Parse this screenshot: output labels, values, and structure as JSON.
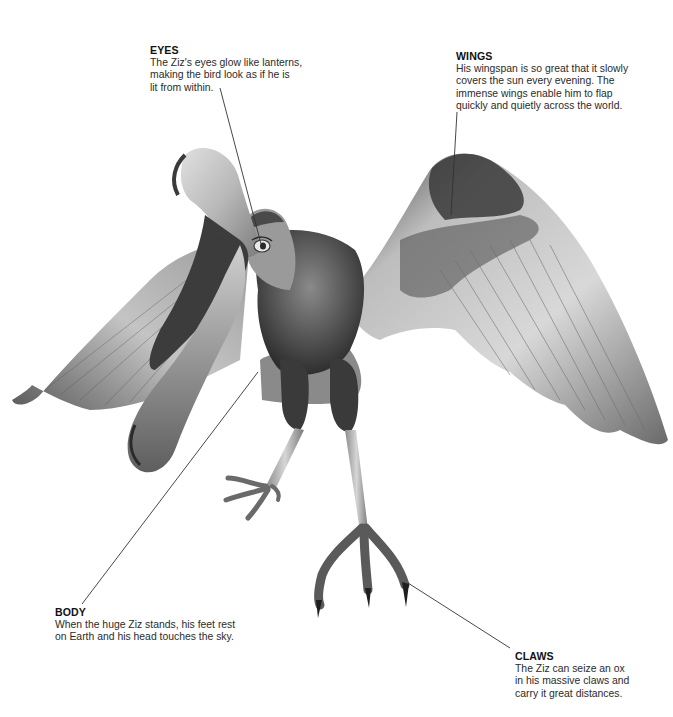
{
  "subject": "Ziz",
  "illustration": {
    "description": "Grayscale illustration of the Ziz, a giant mythical bird with open long beak, outstretched wings and taloned feet",
    "palette": {
      "dark": "#2a2a2a",
      "mid": "#7a7a7a",
      "light": "#d9d9d9",
      "line": "#333333",
      "text": "#231f20"
    }
  },
  "callouts": {
    "eyes": {
      "title": "EYES",
      "lines": [
        "The Ziz's eyes glow like lanterns,",
        "making the bird look as if he is",
        "lit from within."
      ]
    },
    "wings": {
      "title": "WINGS",
      "lines": [
        "His wingspan is so great that it slowly",
        "covers the sun every evening. The",
        "immense wings enable him to flap",
        "quickly and quietly across the world."
      ]
    },
    "body": {
      "title": "BODY",
      "lines": [
        "When the huge Ziz stands, his feet rest",
        "on Earth and his head touches the sky."
      ]
    },
    "claws": {
      "title": "CLAWS",
      "lines": [
        "The Ziz can seize an ox",
        "in his massive claws and",
        "carry it great distances."
      ]
    }
  },
  "leaders": {
    "eyes": {
      "from": [
        220,
        88
      ],
      "to": [
        261,
        244
      ]
    },
    "wings": {
      "from": [
        457,
        112
      ],
      "to": [
        451,
        215
      ]
    },
    "body": {
      "from": [
        82,
        604
      ],
      "to": [
        258,
        372
      ]
    },
    "claws": {
      "from": [
        510,
        648
      ],
      "to": [
        408,
        583
      ]
    }
  }
}
